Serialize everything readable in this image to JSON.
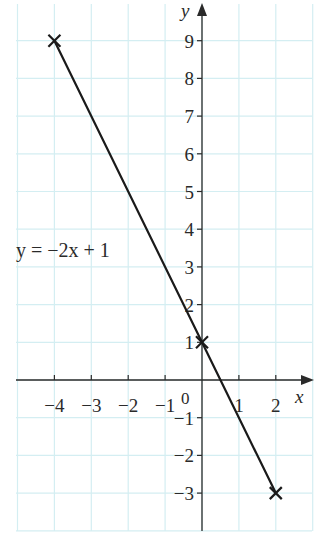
{
  "chart_data": {
    "type": "line",
    "title": "",
    "xlabel": "x",
    "ylabel": "y",
    "xlim": [
      -5,
      3
    ],
    "ylim": [
      -4,
      9.5
    ],
    "grid": true,
    "x_ticks": [
      -4,
      -3,
      -2,
      -1,
      1,
      2
    ],
    "x_tick_labels": [
      "−4",
      "−3",
      "−2",
      "−1",
      "1",
      "2"
    ],
    "y_ticks": [
      9,
      8,
      7,
      6,
      5,
      4,
      3,
      2,
      1,
      -1,
      -2,
      -3
    ],
    "y_tick_labels": [
      "9",
      "8",
      "7",
      "6",
      "5",
      "4",
      "3",
      "2",
      "1",
      "−1",
      "−2",
      "−3"
    ],
    "origin_label": "0",
    "series": [
      {
        "name": "y = −2x + 1",
        "x": [
          -4,
          0,
          2
        ],
        "y": [
          9,
          1,
          -3
        ],
        "marker": "x",
        "color": "#1a1a1a"
      }
    ],
    "annotations": [
      {
        "text": "y = −2x + 1",
        "x": -4.9,
        "y": 3.45
      }
    ]
  },
  "labels": {
    "x_axis": "x",
    "y_axis": "y",
    "origin": "0",
    "equation": "y = −2x + 1"
  },
  "colors": {
    "grid": "#d4eef2",
    "axis": "#2a2a2a",
    "line": "#1a1a1a",
    "origin": "#6a5a6a"
  }
}
